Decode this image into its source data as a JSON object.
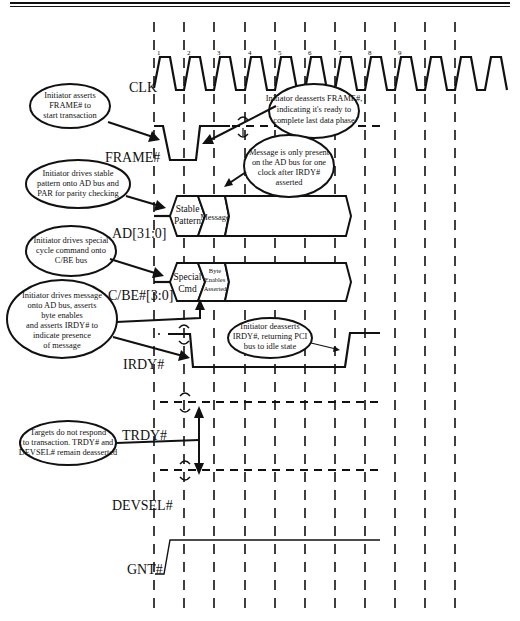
{
  "header": {
    "rule_color": "#111111"
  },
  "diagram": {
    "title_hint": "PCI Special Cycle timing",
    "clock_edges": [
      "1",
      "2",
      "3",
      "4",
      "5",
      "6",
      "7",
      "8",
      "9"
    ],
    "signals": [
      {
        "id": "clk",
        "label": "CLK"
      },
      {
        "id": "frame",
        "label": "FRAME#"
      },
      {
        "id": "ad",
        "label": "AD[31:0]"
      },
      {
        "id": "cbe",
        "label": "C/BE#[3:0]"
      },
      {
        "id": "irdy",
        "label": "IRDY#"
      },
      {
        "id": "trdy",
        "label": "TRDY#"
      },
      {
        "id": "devsel",
        "label": "DEVSEL#"
      },
      {
        "id": "gnt",
        "label": "GNT#"
      }
    ],
    "bus_values": {
      "ad_1_line1": "Stable",
      "ad_1_line2": "Pattern",
      "ad_2": "Message",
      "cbe_1_line1": "Special",
      "cbe_1_line2": "Cmd",
      "cbe_2_line1": "Byte",
      "cbe_2_line2": "Enables",
      "cbe_2_line3": "Asserted"
    },
    "callouts": [
      {
        "id": "frame-assert",
        "lines": [
          "Initiator asserts",
          "FRAME# to",
          "start transaction"
        ]
      },
      {
        "id": "frame-deassert",
        "lines": [
          "Initiator deasserts FRAME#,",
          "indicating it's ready to",
          "complete last data phase"
        ]
      },
      {
        "id": "ad-stable",
        "lines": [
          "Initiator drives stable",
          "pattern onto AD bus and",
          "PAR for parity checking"
        ]
      },
      {
        "id": "msg-present",
        "lines": [
          "Message is only present",
          "on the AD bus for one",
          "clock after IRDY#",
          "asserted"
        ]
      },
      {
        "id": "cbe-special",
        "lines": [
          "Initiator drives special",
          "cycle command onto",
          "C/BE bus"
        ]
      },
      {
        "id": "irdy-assert",
        "lines": [
          "Initiator drives message",
          "onto AD bus, asserts",
          "byte enables",
          "and asserts IRDY# to",
          "indicate presence",
          "of message"
        ]
      },
      {
        "id": "irdy-deassert",
        "lines": [
          "Initiator deasserts",
          "IRDY#, returning PCI",
          "bus to idle state"
        ]
      },
      {
        "id": "targets",
        "lines": [
          "Targets do not respond",
          "to transaction. TRDY# and",
          "DEVSEL# remain deasserted"
        ]
      }
    ]
  }
}
